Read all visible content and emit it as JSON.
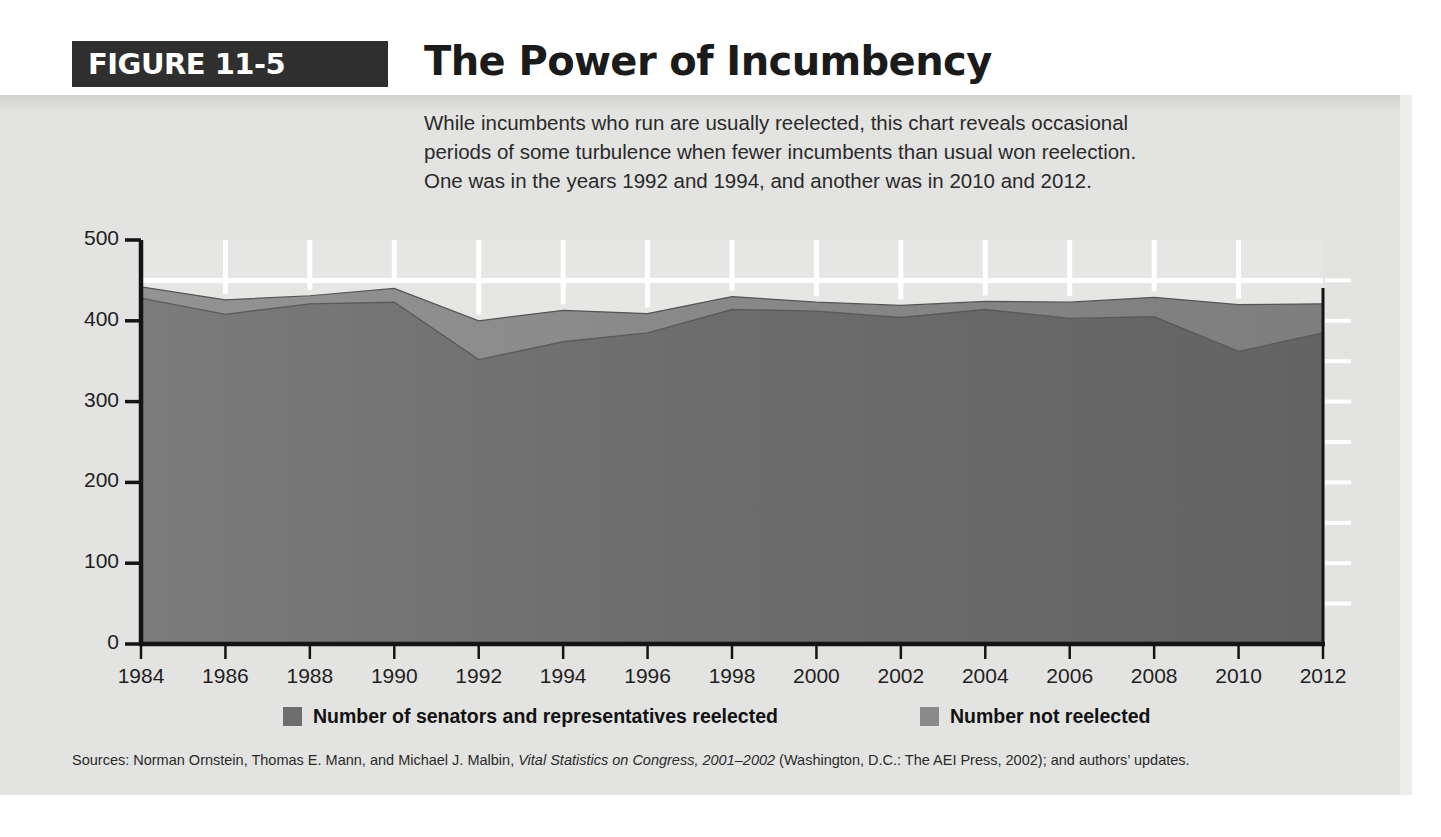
{
  "figure": {
    "tag": "FIGURE 11-5",
    "title": "The Power of Incumbency"
  },
  "description": {
    "line1": "While incumbents who run are usually reelected, this chart reveals occasional",
    "line2": "periods of some turbulence when fewer incumbents than usual won reelection.",
    "line3": "One was in the years 1992 and 1994, and another was in 2010 and 2012."
  },
  "legend": {
    "items": [
      {
        "label": "Number of senators and representatives reelected",
        "color": "#6e6e6e"
      },
      {
        "label": "Number not reelected",
        "color": "#8a8a8a"
      }
    ]
  },
  "source": {
    "prefix": "Sources: Norman Ornstein, Thomas E. Mann, and Michael J. Malbin, ",
    "italic": "Vital Statistics on Congress, 2001–2002",
    "suffix": " (Washington, D.C.: The AEI Press, 2002); and authors’ updates."
  },
  "colors": {
    "panel_background": "#e3e3e1",
    "reelected_band": "#6e6e6e",
    "not_reelected_band": "#8a8a8a",
    "gridline": "#ffffff",
    "axis": "#1a1a1a",
    "tag_background": "#2f2f2f"
  },
  "chart_data": {
    "type": "area",
    "title": "The Power of Incumbency",
    "subtitle": "While incumbents who run are usually reelected, this chart reveals occasional periods of some turbulence when fewer incumbents than usual won reelection. One was in the years 1992 and 1994, and another was in 2010 and 2012.",
    "xlabel": "",
    "ylabel": "",
    "stacked": true,
    "grid": true,
    "legend_position": "bottom",
    "ylim": [
      0,
      500
    ],
    "yticks": [
      0,
      100,
      200,
      300,
      400,
      500
    ],
    "yticks_minor_step": 50,
    "xlim": [
      1984,
      2012
    ],
    "x": [
      1984,
      1986,
      1988,
      1990,
      1992,
      1994,
      1996,
      1998,
      2000,
      2002,
      2004,
      2006,
      2008,
      2010,
      2012
    ],
    "categories": [
      "1984",
      "1986",
      "1988",
      "1990",
      "1992",
      "1994",
      "1996",
      "1998",
      "2000",
      "2002",
      "2004",
      "2006",
      "2008",
      "2010",
      "2012"
    ],
    "series": [
      {
        "name": "Number of senators and representatives reelected",
        "color": "#6e6e6e",
        "values": [
          428,
          408,
          421,
          423,
          352,
          374,
          385,
          414,
          412,
          404,
          414,
          403,
          405,
          362,
          385
        ]
      },
      {
        "name": "Number not reelected",
        "color": "#8a8a8a",
        "values": [
          14,
          18,
          10,
          17,
          48,
          39,
          24,
          16,
          11,
          15,
          10,
          20,
          24,
          58,
          36
        ]
      }
    ],
    "totals": [
      442,
      426,
      431,
      440,
      400,
      413,
      409,
      430,
      423,
      419,
      424,
      423,
      429,
      420,
      421
    ]
  }
}
